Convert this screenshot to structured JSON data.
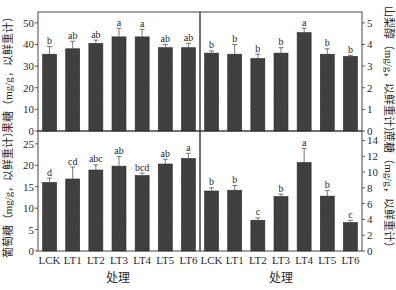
{
  "chart_data": [
    {
      "type": "bar",
      "panel": "top-left",
      "title": "",
      "xlabel": "",
      "ylabel": "果糖（mg/g，以鲜重计）",
      "categories": [
        "LCK",
        "LT1",
        "LT2",
        "LT3",
        "LT4",
        "LT5",
        "LT6"
      ],
      "values": [
        35.5,
        38,
        40.5,
        43.5,
        43.5,
        38.5,
        38.5
      ],
      "errors": [
        3.5,
        3.5,
        1.5,
        4,
        3.5,
        1.5,
        2
      ],
      "letters": [
        "b",
        "ab",
        "ab",
        "a",
        "a",
        "ab",
        "ab"
      ],
      "ylim": [
        0,
        55
      ],
      "yticks": [
        0,
        10,
        20,
        30,
        40,
        50
      ],
      "grid": false
    },
    {
      "type": "bar",
      "panel": "top-right",
      "title": "",
      "xlabel": "",
      "ylabel": "山梨醇（mg/g，以鲜重计）",
      "categories": [
        "LCK",
        "LT1",
        "LT2",
        "LT3",
        "LT4",
        "LT5",
        "LT6"
      ],
      "values": [
        3.6,
        3.55,
        3.35,
        3.6,
        4.55,
        3.55,
        3.45
      ],
      "errors": [
        0.1,
        0.45,
        0.2,
        0.25,
        0.2,
        0.25,
        0.05
      ],
      "letters": [
        "b",
        "b",
        "b",
        "b",
        "a",
        "b",
        "b"
      ],
      "ylim": [
        0,
        5.5
      ],
      "yticks": [
        0,
        1,
        2,
        3,
        4,
        5
      ],
      "grid": false
    },
    {
      "type": "bar",
      "panel": "bottom-left",
      "title": "",
      "xlabel": "处理",
      "ylabel": "葡萄糖（mg/g，以鲜重计）",
      "categories": [
        "LCK",
        "LT1",
        "LT2",
        "LT3",
        "LT4",
        "LT5",
        "LT6"
      ],
      "values": [
        16,
        16.8,
        18.9,
        19.8,
        17.6,
        20.3,
        21.6
      ],
      "errors": [
        1,
        2.8,
        1.2,
        2.2,
        0.6,
        1.1,
        1.2
      ],
      "letters": [
        "d",
        "cd",
        "abc",
        "ab",
        "bcd",
        "ab",
        "a"
      ],
      "ylim": [
        0,
        28
      ],
      "yticks": [
        0,
        5,
        10,
        15,
        20,
        25
      ],
      "grid": false
    },
    {
      "type": "bar",
      "panel": "bottom-right",
      "title": "",
      "xlabel": "处理",
      "ylabel": "蔗糖（mg/g，以鲜重计）",
      "categories": [
        "LCK",
        "LT1",
        "LT2",
        "LT3",
        "LT4",
        "LT5",
        "LT6"
      ],
      "values": [
        7.6,
        7.7,
        3.9,
        6.9,
        11.2,
        6.95,
        3.6
      ],
      "errors": [
        0.4,
        0.6,
        0.3,
        0.3,
        1.8,
        0.7,
        0.3
      ],
      "letters": [
        "b",
        "b",
        "c",
        "b",
        "a",
        "b",
        "c"
      ],
      "ylim": [
        0,
        15.2
      ],
      "yticks": [
        0,
        2,
        4,
        6,
        8,
        10,
        12,
        14
      ],
      "grid": false
    }
  ],
  "labels": {
    "xlabel_left": "处理",
    "xlabel_right": "处理",
    "ylabel_top_left": "果糖（mg/g，以鲜重计）",
    "ylabel_bottom_left": "葡萄糖（mg/g，以鲜重计）",
    "ylabel_top_right": "山梨醇（mg/g，以鲜重计）",
    "ylabel_bottom_right": "蔗糖（mg/g，以鲜重计）"
  },
  "colors": {
    "bar": "#3b3b3b",
    "axis": "#333333",
    "text": "#2a2a2a"
  }
}
